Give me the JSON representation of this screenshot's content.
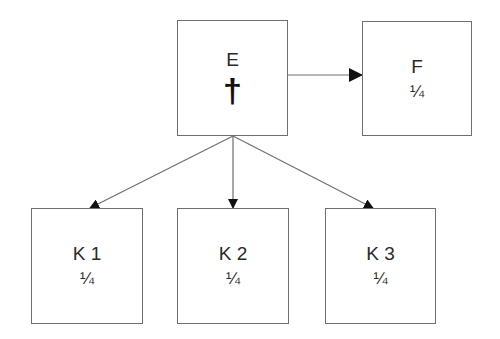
{
  "diagram": {
    "type": "inheritance-tree",
    "nodes": [
      {
        "id": "E",
        "label": "E",
        "marker": "†",
        "marker_meaning": "deceased"
      },
      {
        "id": "F",
        "label": "F",
        "share": "¼"
      },
      {
        "id": "K1",
        "label": "K 1",
        "share": "¼"
      },
      {
        "id": "K2",
        "label": "K 2",
        "share": "¼"
      },
      {
        "id": "K3",
        "label": "K 3",
        "share": "¼"
      }
    ],
    "edges": [
      {
        "from": "E",
        "to": "F"
      },
      {
        "from": "E",
        "to": "K1"
      },
      {
        "from": "E",
        "to": "K2"
      },
      {
        "from": "E",
        "to": "K3"
      }
    ],
    "colors": {
      "stroke": "#6f6f6f",
      "arrowhead": "#111111",
      "text": "#2a2a2a"
    }
  }
}
